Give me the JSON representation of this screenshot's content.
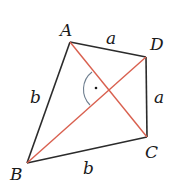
{
  "diagram": {
    "type": "kite",
    "colors": {
      "sides": "#2b2b2b",
      "diagonals": "#d9604f",
      "angle_arc": "#6f7f90",
      "label": "#1a1a1a"
    },
    "vertices": {
      "A": {
        "label": "A",
        "x": 70,
        "y": 42
      },
      "B": {
        "label": "B",
        "x": 27,
        "y": 163
      },
      "C": {
        "label": "C",
        "x": 147,
        "y": 137
      },
      "D": {
        "label": "D",
        "x": 146,
        "y": 57
      }
    },
    "sides": [
      {
        "from": "A",
        "to": "D",
        "label": "a"
      },
      {
        "from": "D",
        "to": "C",
        "label": "a"
      },
      {
        "from": "C",
        "to": "B",
        "label": "b"
      },
      {
        "from": "B",
        "to": "A",
        "label": "b"
      }
    ],
    "diagonals": [
      {
        "from": "A",
        "to": "C"
      },
      {
        "from": "B",
        "to": "D"
      }
    ],
    "right_angle_marker": {
      "style": "arc-with-dot"
    }
  }
}
